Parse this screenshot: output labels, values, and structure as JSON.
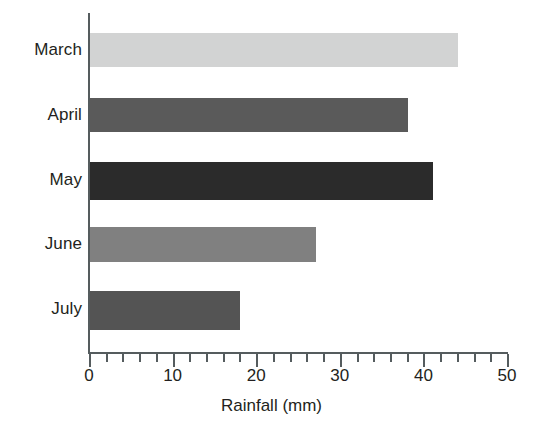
{
  "chart_data": {
    "type": "bar",
    "orientation": "horizontal",
    "title": "",
    "xlabel": "Rainfall (mm)",
    "ylabel": "",
    "categories": [
      "March",
      "April",
      "May",
      "June",
      "July"
    ],
    "values": [
      44,
      38,
      41,
      27,
      18
    ],
    "series": [
      {
        "name": "Rainfall",
        "values": [
          44,
          38,
          41,
          27,
          18
        ]
      }
    ],
    "bar_colors": [
      "#d2d3d3",
      "#5a5a5a",
      "#2b2b2b",
      "#808080",
      "#545454"
    ],
    "xlim": [
      0,
      50
    ],
    "xticks": [
      0,
      10,
      20,
      30,
      40,
      50
    ],
    "xtick_labels": [
      "0",
      "10",
      "20",
      "30",
      "40",
      "50"
    ],
    "minor_tick_step": 2,
    "grid": false,
    "legend": false,
    "axis_color": "#555c5e",
    "text_color": "#231f20",
    "background": "#ffffff"
  }
}
